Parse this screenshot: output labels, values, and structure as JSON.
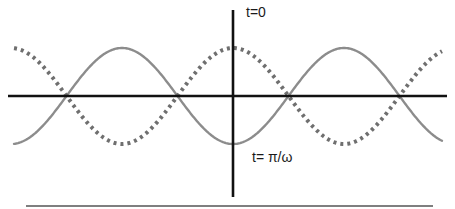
{
  "diagram": {
    "title": "",
    "labels": {
      "t0": "t=0",
      "t_pi_omega": "t= π/ω"
    },
    "curves": [
      {
        "name": "wave-at-t-pi-over-omega",
        "style": "solid",
        "color": "#8a8a8a",
        "phase": "min at origin"
      },
      {
        "name": "wave-at-t0",
        "style": "dotted",
        "color": "#7a7a7a",
        "phase": "max at origin"
      }
    ],
    "axes": {
      "color": "#111111",
      "origin_x": 233,
      "origin_y": 96,
      "x_start": 8,
      "x_end": 447,
      "y_top": 10,
      "y_bottom": 197
    },
    "wave": {
      "amplitude_px": 48,
      "period_px": 222,
      "x_start": 14,
      "x_end": 442,
      "zero_crossings_px": [
        69,
        181,
        289,
        400
      ]
    },
    "baseline_rule": {
      "x1": 26,
      "x2": 433,
      "y": 206,
      "color": "#555555"
    }
  }
}
